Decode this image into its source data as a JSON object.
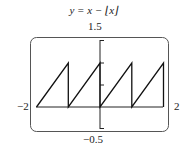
{
  "chart_data": {
    "type": "line",
    "xlabel": "",
    "ylabel": "",
    "xlim": [
      -2,
      2
    ],
    "ylim": [
      -0.5,
      1.5
    ],
    "x_tick_labels": [
      "−2",
      "2"
    ],
    "y_tick_labels": [
      "1.5",
      "−0.5"
    ],
    "y_ticks": [
      1.5,
      1,
      0.5,
      -0.5
    ],
    "grid": false,
    "legend": null,
    "series": [
      {
        "name": "y = x − [x]",
        "x": [
          -2,
          -1,
          -1,
          0,
          0,
          1,
          1,
          2,
          2
        ],
        "y": [
          0,
          1,
          0,
          1,
          0,
          1,
          0,
          1,
          0
        ]
      }
    ]
  },
  "labels": {
    "title": "y = x − ⌊x⌋",
    "ymax": "1.5",
    "ymin": "−0.5",
    "xmin": "−2",
    "xmax": "2"
  }
}
